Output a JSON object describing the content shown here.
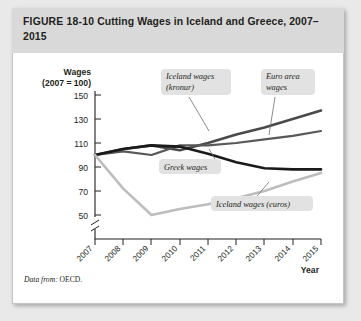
{
  "figure": {
    "number": "FIGURE  18-10",
    "title": "Cutting Wages in Iceland and Greece, 2007–2015",
    "source_label": "Data from:",
    "source_value": "OECD."
  },
  "chart_data": {
    "type": "line",
    "title": "Cutting Wages in Iceland and Greece, 2007–2015",
    "ylabel_line1": "Wages",
    "ylabel_line2": "(2007 = 100)",
    "xlabel": "Year",
    "categories": [
      "2007",
      "2008",
      "2009",
      "2010",
      "2011",
      "2012",
      "2013",
      "2014",
      "2015"
    ],
    "yticks": [
      50,
      70,
      90,
      110,
      130,
      150
    ],
    "ylim": [
      40,
      158
    ],
    "grid": false,
    "axis_break": true,
    "legend": "annotations",
    "series": [
      {
        "name": "Iceland wages (kronur)",
        "color": "#4a4a4a",
        "width": 2.6,
        "values": [
          100,
          105,
          108,
          104,
          110,
          117,
          123,
          130,
          137
        ]
      },
      {
        "name": "Euro area wages",
        "color": "#585858",
        "width": 2.2,
        "values": [
          100,
          103,
          100,
          108,
          108,
          110,
          113,
          116,
          120
        ]
      },
      {
        "name": "Greek wages",
        "color": "#1a1a1a",
        "width": 2.6,
        "values": [
          100,
          105,
          108,
          107,
          101,
          94,
          89,
          88,
          88
        ]
      },
      {
        "name": "Iceland wages (euros)",
        "color": "#bdbdbd",
        "width": 2.6,
        "values": [
          100,
          72,
          50,
          55,
          59,
          64,
          70,
          78,
          85
        ]
      }
    ],
    "annotations": [
      {
        "text_line1": "Iceland wages",
        "text_line2": "(kronur)",
        "name": "callout-iceland-kronur"
      },
      {
        "text_line1": "Euro area",
        "text_line2": "wages",
        "name": "callout-euro-area"
      },
      {
        "text_line1": "Greek wages",
        "text_line2": "",
        "name": "callout-greek-wages"
      },
      {
        "text_line1": "Iceland wages (euros)",
        "text_line2": "",
        "name": "callout-iceland-euros"
      }
    ]
  }
}
